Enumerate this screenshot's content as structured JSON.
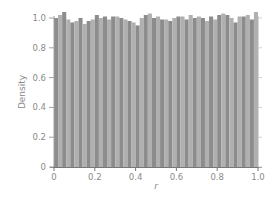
{
  "chart_data": {
    "type": "bar",
    "title": "",
    "xlabel": "r",
    "ylabel": "Density",
    "xlim": [
      0,
      1.0
    ],
    "ylim": [
      0,
      1.0
    ],
    "grid": false,
    "legend": null,
    "bin_width": 0.02,
    "x_ticks": [
      "0",
      "0.2",
      "0.4",
      "0.6",
      "0.8",
      "1.0"
    ],
    "y_ticks": [
      "0",
      "0.2",
      "0.4",
      "0.6",
      "0.8",
      "1.0"
    ],
    "categories": [
      0.0,
      0.02,
      0.04,
      0.06,
      0.08,
      0.1,
      0.12,
      0.14,
      0.16,
      0.18,
      0.2,
      0.22,
      0.24,
      0.26,
      0.28,
      0.3,
      0.32,
      0.34,
      0.36,
      0.38,
      0.4,
      0.42,
      0.44,
      0.46,
      0.48,
      0.5,
      0.52,
      0.54,
      0.56,
      0.58,
      0.6,
      0.62,
      0.64,
      0.66,
      0.68,
      0.7,
      0.72,
      0.74,
      0.76,
      0.78,
      0.8,
      0.82,
      0.84,
      0.86,
      0.88,
      0.9,
      0.92,
      0.94,
      0.96,
      0.98
    ],
    "values": [
      1.0,
      1.02,
      1.04,
      0.99,
      0.97,
      0.98,
      1.0,
      0.96,
      0.98,
      0.99,
      1.02,
      1.0,
      1.01,
      0.99,
      1.01,
      1.01,
      1.0,
      0.99,
      0.98,
      0.97,
      0.95,
      1.0,
      1.02,
      1.03,
      1.0,
      1.01,
      0.99,
      0.99,
      0.98,
      1.0,
      1.01,
      1.01,
      0.99,
      1.02,
      1.0,
      1.01,
      1.0,
      0.98,
      1.01,
      0.99,
      1.02,
      1.03,
      1.02,
      1.0,
      0.97,
      1.01,
      1.01,
      1.02,
      0.99,
      1.04
    ],
    "colors": {
      "bar_dark": "#8c8c8c",
      "bar_light": "#b0b0b0",
      "axis": "#a0a0a0",
      "text": "#8a8a8a"
    }
  },
  "axes": {
    "xlabel": "r",
    "ylabel": "Density",
    "x_ticks": [
      "0",
      "0.2",
      "0.4",
      "0.6",
      "0.8",
      "1.0"
    ],
    "y_ticks": [
      "0",
      "0.2",
      "0.4",
      "0.6",
      "0.8",
      "1.0"
    ]
  }
}
